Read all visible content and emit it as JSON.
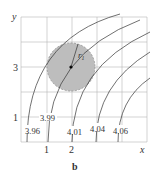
{
  "figure": {
    "panel_label": "b",
    "axes": {
      "x_label": "x",
      "y_label": "y",
      "x_ticks": [
        "1",
        "2"
      ],
      "y_ticks": [
        "3",
        "1"
      ]
    },
    "circle": {
      "radius_label": "r",
      "radius_subscript": "1",
      "fill": "#bdbdbd"
    },
    "contours": [
      {
        "label": "3.96"
      },
      {
        "label": "3.99"
      },
      {
        "label": "4.01"
      },
      {
        "label": "4.04"
      },
      {
        "label": "4.06"
      }
    ]
  }
}
